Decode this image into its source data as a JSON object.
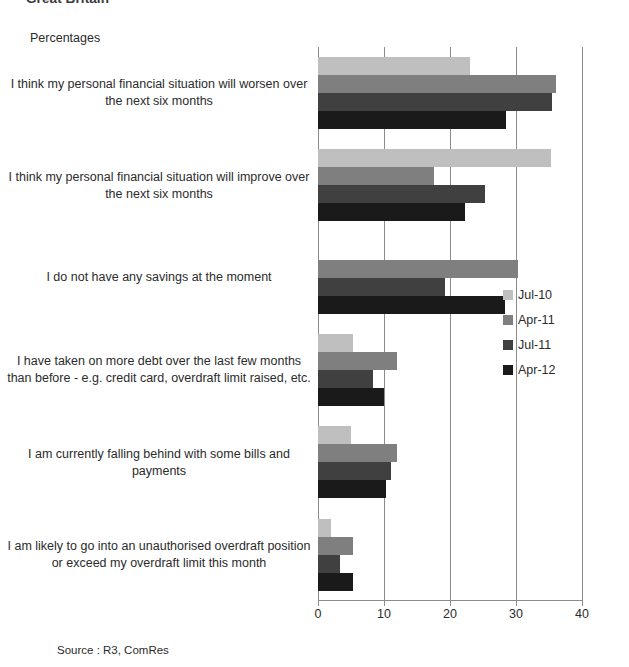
{
  "heading": "Great Britain",
  "axis_title": "Percentages",
  "source": "Source : R3, ComRes",
  "chart_data": {
    "type": "bar",
    "orientation": "horizontal",
    "title": "Great Britain",
    "xlabel": "Percentages",
    "ylabel": "",
    "xlim": [
      0,
      40
    ],
    "xticks": [
      0,
      10,
      20,
      30,
      40
    ],
    "grid": true,
    "legend_position": "right",
    "categories": [
      "I think my personal financial situation will worsen over the next six months",
      "I think my personal financial situation will improve over the next six months",
      "I do not have any savings at the moment",
      "I have taken on more debt over the last few months than before - e.g. credit card, overdraft limit raised, etc.",
      "I am currently falling behind with some bills and payments",
      "I am likely to go into an unauthorised overdraft position or exceed my overdraft limit this month"
    ],
    "series": [
      {
        "name": "Jul-10",
        "color": "#bfbfbf",
        "values": [
          23,
          35.3,
          null,
          5.3,
          5,
          2
        ]
      },
      {
        "name": "Apr-11",
        "color": "#7f7f7f",
        "values": [
          36,
          17.5,
          30.3,
          12,
          12,
          5.3
        ]
      },
      {
        "name": "Jul-11",
        "color": "#404040",
        "values": [
          35.5,
          25.3,
          19.3,
          8.3,
          11,
          3.3
        ]
      },
      {
        "name": "Apr-12",
        "color": "#1a1a1a",
        "values": [
          28.5,
          22.3,
          28.3,
          10,
          10.3,
          5.3
        ]
      }
    ]
  }
}
